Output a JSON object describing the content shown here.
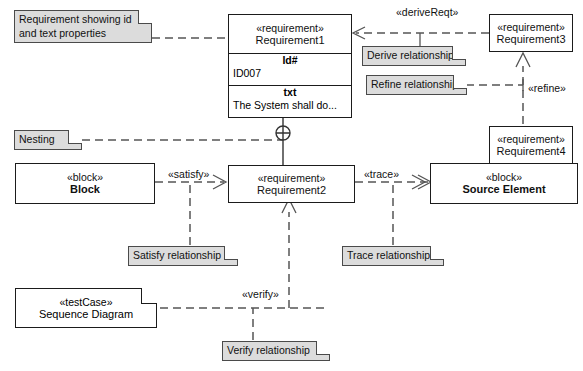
{
  "diagram": {
    "type": "SysML Requirements Diagram",
    "nodes": {
      "requirement1": {
        "stereotype": "«requirement»",
        "name": "Requirement1",
        "compartments": [
          {
            "title": "Id#",
            "value": "ID007"
          },
          {
            "title": "txt",
            "value": "The System shall do..."
          }
        ]
      },
      "requirement2": {
        "stereotype": "«requirement»",
        "name": "Requirement2"
      },
      "requirement3": {
        "stereotype": "«requirement»",
        "name": "Requirement3"
      },
      "requirement4": {
        "stereotype": "«requirement»",
        "name": "Requirement4"
      },
      "block": {
        "stereotype": "«block»",
        "name": "Block"
      },
      "source_element": {
        "stereotype": "«block»",
        "name": "Source Element"
      },
      "test_case": {
        "stereotype": "«testCase»",
        "name": "Sequence Diagram"
      }
    },
    "notes": {
      "requirement_props": "Requirement showing id and text properties",
      "nesting": "Nesting",
      "derive": "Derive relationship",
      "refine": "Refine relationship",
      "satisfy": "Satisfy relationship",
      "trace": "Trace relationship",
      "verify": "Verify relationship"
    },
    "edge_labels": {
      "derive_reqt": "«deriveReqt»",
      "refine": "«refine»",
      "satisfy": "«satisfy»",
      "trace": "«trace»",
      "verify": "«verify»"
    },
    "colors": {
      "note_fill": "#dcdcdc",
      "note_border": "#4a4a4a",
      "box_border": "#1b1b1b",
      "box_fill": "#ffffff",
      "edge": "#555555"
    }
  }
}
